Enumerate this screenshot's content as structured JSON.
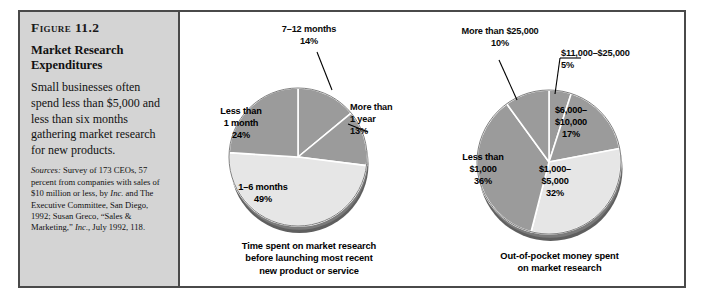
{
  "figure": {
    "number": "Figure 11.2",
    "title": "Market Research Expenditures",
    "description": "Small businesses often spend less than $5,000 and less than six months gathering market research for new products.",
    "sources_label": "Sources:",
    "sources_part1": " Survey of 173 CEOs, 57 percent from companies with sales of $10 million or less, by ",
    "sources_inc1": "Inc.",
    "sources_part2": " and The Executive Committee, San Diego, 1992; Susan Greco, “Sales & Marketing,” ",
    "sources_inc2": "Inc.,",
    "sources_part3": " July 1992, 118."
  },
  "colors": {
    "panel_bg": "#d4d4d4",
    "frame": "#4a4a4a",
    "slice_medium": "#9b9b9b",
    "slice_light": "#e6e6e6",
    "slice_dark_edge": "#5a5a5a",
    "divider": "#ffffff"
  },
  "chart_data": [
    {
      "type": "pie",
      "id": "time-spent-pie",
      "title": "Time spent on market research before launching most recent new product or service",
      "caption_lines": [
        "Time spent on market research",
        "before launching most recent",
        "new product or service"
      ],
      "start_angle_deg": 0,
      "direction": "clockwise",
      "labels": [
        "7–12 months",
        "More than 1 year",
        "1–6 months",
        "Less than 1 month"
      ],
      "values": [
        14,
        13,
        49,
        24
      ],
      "unit": "%",
      "slices": [
        {
          "label": "7–12 months",
          "label_lines": [
            "7–12 months",
            "14%"
          ],
          "value": 14,
          "value_text": "14%",
          "shade": "medium",
          "placement": "outside-leader"
        },
        {
          "label": "More than 1 year",
          "label_lines": [
            "More than",
            "1 year",
            "13%"
          ],
          "value": 13,
          "value_text": "13%",
          "shade": "medium",
          "placement": "outside-leader"
        },
        {
          "label": "1–6 months",
          "label_lines": [
            "1–6 months",
            "49%"
          ],
          "value": 49,
          "value_text": "49%",
          "shade": "light",
          "placement": "inside"
        },
        {
          "label": "Less than 1 month",
          "label_lines": [
            "Less than",
            "1 month",
            "24%"
          ],
          "value": 24,
          "value_text": "24%",
          "shade": "medium",
          "placement": "inside"
        }
      ]
    },
    {
      "type": "pie",
      "id": "money-spent-pie",
      "title": "Out-of-pocket money spent on market research",
      "caption_lines": [
        "Out-of-pocket money spent",
        "on market research"
      ],
      "start_angle_deg": 0,
      "direction": "clockwise",
      "labels": [
        "$11,000–$25,000",
        "$6,000–$10,000",
        "$1,000–$5,000",
        "Less than $1,000",
        "More than $25,000"
      ],
      "values": [
        5,
        17,
        32,
        36,
        10
      ],
      "unit": "%",
      "slices": [
        {
          "label": "$11,000–$25,000",
          "label_lines": [
            "$11,000–$25,000",
            "5%"
          ],
          "value": 5,
          "value_text": "5%",
          "shade": "medium",
          "placement": "outside-leader"
        },
        {
          "label": "$6,000–$10,000",
          "label_lines": [
            "$6,000–",
            "$10,000",
            "17%"
          ],
          "value": 17,
          "value_text": "17%",
          "shade": "medium",
          "placement": "inside"
        },
        {
          "label": "$1,000–$5,000",
          "label_lines": [
            "$1,000–",
            "$5,000",
            "32%"
          ],
          "value": 32,
          "value_text": "32%",
          "shade": "light",
          "placement": "inside"
        },
        {
          "label": "Less than $1,000",
          "label_lines": [
            "Less than",
            "$1,000",
            "36%"
          ],
          "value": 36,
          "value_text": "36%",
          "shade": "medium",
          "placement": "inside"
        },
        {
          "label": "More than $25,000",
          "label_lines": [
            "More than $25,000",
            "10%"
          ],
          "value": 10,
          "value_text": "10%",
          "shade": "medium",
          "placement": "outside-leader"
        }
      ]
    }
  ]
}
